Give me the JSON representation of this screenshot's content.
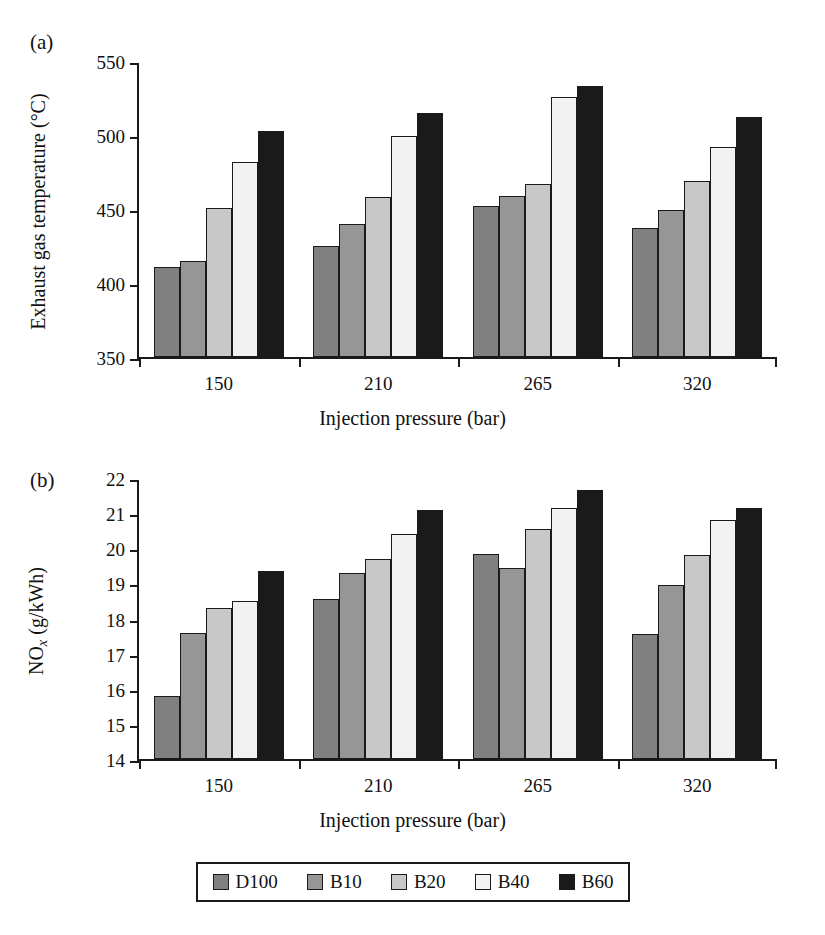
{
  "figure": {
    "panels": [
      {
        "letter": "(a)",
        "ylabel": "Exhaust gas temperature (°C)",
        "xlabel": "Injection pressure (bar)"
      },
      {
        "letter": "(b)",
        "ylabel_prefix": "NO",
        "ylabel_sub": "x",
        "ylabel_suffix": " (g/kWh)",
        "xlabel": "Injection pressure (bar)"
      }
    ]
  },
  "legend": {
    "items": [
      {
        "label": "D100",
        "color": "#808080"
      },
      {
        "label": "B10",
        "color": "#969696"
      },
      {
        "label": "B20",
        "color": "#c8c8c8"
      },
      {
        "label": "B40",
        "color": "#f2f2f2"
      },
      {
        "label": "B60",
        "color": "#1a1a1a"
      }
    ]
  },
  "chart_data": [
    {
      "type": "bar",
      "panel": "(a)",
      "title": "Exhaust gas temperature vs injection pressure",
      "xlabel": "Injection pressure (bar)",
      "ylabel": "Exhaust gas temperature (°C)",
      "categories": [
        "150",
        "210",
        "265",
        "320"
      ],
      "ylim": [
        350,
        550
      ],
      "yticks": [
        350,
        400,
        450,
        500,
        550
      ],
      "grid": false,
      "legend_position": "bottom",
      "series": [
        {
          "name": "D100",
          "color": "#808080",
          "values": [
            411,
            425,
            452,
            437
          ]
        },
        {
          "name": "B10",
          "color": "#969696",
          "values": [
            415,
            440,
            459,
            449
          ]
        },
        {
          "name": "B20",
          "color": "#c8c8c8",
          "values": [
            451,
            458,
            467,
            469
          ]
        },
        {
          "name": "B40",
          "color": "#f2f2f2",
          "values": [
            482,
            499,
            526,
            492
          ]
        },
        {
          "name": "B60",
          "color": "#1a1a1a",
          "values": [
            503,
            515,
            533,
            512
          ]
        }
      ]
    },
    {
      "type": "bar",
      "panel": "(b)",
      "title": "NOx emissions vs injection pressure",
      "xlabel": "Injection pressure (bar)",
      "ylabel": "NOx (g/kWh)",
      "categories": [
        "150",
        "210",
        "265",
        "320"
      ],
      "ylim": [
        14,
        22
      ],
      "yticks": [
        14,
        15,
        16,
        17,
        18,
        19,
        20,
        21,
        22
      ],
      "grid": false,
      "legend_position": "bottom",
      "series": [
        {
          "name": "D100",
          "color": "#808080",
          "values": [
            15.8,
            18.55,
            19.85,
            17.55
          ]
        },
        {
          "name": "B10",
          "color": "#969696",
          "values": [
            17.6,
            19.3,
            19.45,
            18.95
          ]
        },
        {
          "name": "B20",
          "color": "#c8c8c8",
          "values": [
            18.3,
            19.7,
            20.55,
            19.8
          ]
        },
        {
          "name": "B40",
          "color": "#f2f2f2",
          "values": [
            18.5,
            20.4,
            21.15,
            20.8
          ]
        },
        {
          "name": "B60",
          "color": "#1a1a1a",
          "values": [
            19.35,
            21.1,
            21.65,
            21.15
          ]
        }
      ]
    }
  ]
}
